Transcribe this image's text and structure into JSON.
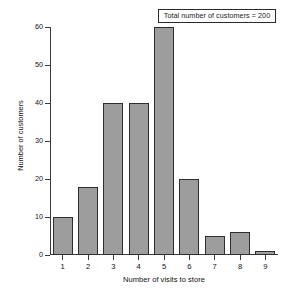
{
  "chart_data": {
    "type": "bar",
    "title": "",
    "subtitle": "",
    "xlabel": "Number of visits to store",
    "ylabel": "Number of customers",
    "categories": [
      "1",
      "2",
      "3",
      "4",
      "5",
      "6",
      "7",
      "8",
      "9"
    ],
    "values": [
      10,
      18,
      40,
      40,
      60,
      20,
      5,
      6,
      1
    ],
    "ylim": [
      0,
      60
    ],
    "yticks": [
      0,
      10,
      20,
      30,
      40,
      50,
      60
    ],
    "xticks": [
      "1",
      "2",
      "3",
      "4",
      "5",
      "6",
      "7",
      "8",
      "9"
    ],
    "grid": false,
    "legend": "none",
    "annotations": [
      {
        "text": "Total number of customers = 200",
        "position": "top-right",
        "boxed": true
      }
    ],
    "series": [
      {
        "name": "Number of customers",
        "values": [
          10,
          18,
          40,
          40,
          60,
          20,
          5,
          6,
          1
        ]
      }
    ]
  },
  "colors": {
    "bar_fill": "#9d9d9d",
    "bar_edge": "#2e2e2e",
    "axis": "#3a3a3a",
    "text": "#111111",
    "background": "#ffffff"
  },
  "annotation": {
    "text": "Total number of customers = 200"
  }
}
